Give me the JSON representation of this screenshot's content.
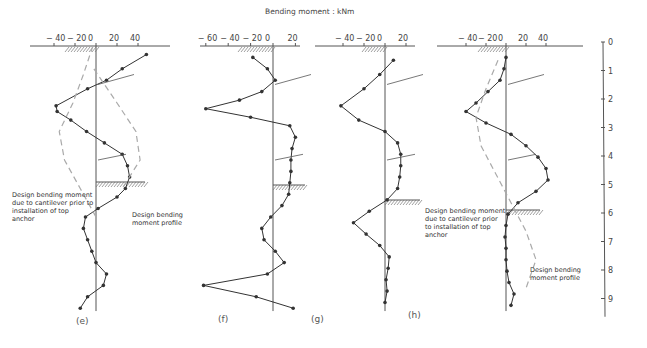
{
  "figure": {
    "title": "Bending moment : kNm",
    "depth_scale": {
      "labels": [
        "0",
        "1",
        "2",
        "3",
        "4",
        "5",
        "6",
        "7",
        "8",
        "9"
      ]
    },
    "annotations": {
      "cantilever": [
        "Design bending moment",
        "due to cantilever prior to",
        "installation of top",
        "anchor"
      ],
      "profile": [
        "Design bending",
        "moment profile"
      ],
      "cantilever_h": [
        "Design bending moment",
        "due to cantilever prior",
        "to installation of top",
        "anchor"
      ],
      "profile_h": [
        "Design bending",
        "moment profile"
      ]
    },
    "panels": [
      {
        "id": "e",
        "caption": "(e)",
        "ticks": [
          "− 40",
          "− 20",
          "0",
          "20",
          "40"
        ]
      },
      {
        "id": "f",
        "caption": "(f)",
        "ticks": [
          "− 60",
          "− 40",
          "− 20",
          "0",
          "20"
        ]
      },
      {
        "id": "g",
        "caption": "(g)",
        "ticks": [
          "− 40",
          "− 20",
          "0",
          "20"
        ]
      },
      {
        "id": "h",
        "caption": "(h)",
        "ticks": [
          "− 40",
          "− 20",
          "0",
          "20",
          "40"
        ]
      }
    ]
  },
  "chart_data": [
    {
      "type": "line",
      "title": "Bending moment : kNm",
      "panel": "(e)",
      "xlabel": "Bending moment (kNm)",
      "ylabel": "Depth (m)",
      "xlim": [
        -45,
        50
      ],
      "ylim": [
        9.5,
        0
      ],
      "series": [
        {
          "name": "Design bending moment profile",
          "depth": [
            0.3,
            0.8,
            1.2,
            1.5,
            2.1,
            2.3,
            2.6,
            3.0,
            3.4,
            3.8,
            4.2,
            4.6,
            5.0,
            5.3,
            5.7,
            6.0,
            6.4,
            6.8,
            7.2,
            7.6,
            8.0,
            8.4,
            8.8,
            9.2
          ],
          "moment": [
            48,
            25,
            10,
            -8,
            -38,
            -37,
            -24,
            -9,
            8,
            25,
            30,
            32,
            28,
            20,
            2,
            -10,
            -12,
            -8,
            -4,
            0,
            10,
            7,
            -8,
            -15
          ]
        },
        {
          "name": "Design bending moment due to cantilever prior to installation of top anchor",
          "depth": [
            0,
            1,
            2,
            3,
            4,
            5,
            6
          ],
          "moment": [
            -3,
            -12,
            -22,
            -35,
            -30,
            -15,
            0
          ]
        },
        {
          "name": "Cantilever (positive branch)",
          "depth": [
            0.8,
            2,
            3,
            4,
            5
          ],
          "moment": [
            -2,
            20,
            38,
            42,
            25
          ]
        }
      ]
    },
    {
      "type": "line",
      "panel": "(f)",
      "xlabel": "Bending moment (kNm)",
      "ylabel": "Depth (m)",
      "xlim": [
        -65,
        25
      ],
      "ylim": [
        9.5,
        0
      ],
      "series": [
        {
          "name": "Design bending moment profile",
          "depth": [
            0.4,
            0.8,
            1.2,
            1.6,
            1.9,
            2.2,
            2.5,
            2.8,
            3.2,
            3.6,
            4.0,
            4.4,
            4.8,
            5.2,
            5.6,
            6.0,
            6.4,
            6.8,
            7.2,
            7.6,
            8.0,
            8.4,
            8.8,
            9.2
          ],
          "moment": [
            -18,
            -5,
            2,
            -10,
            -30,
            -60,
            -20,
            15,
            20,
            17,
            16,
            16,
            15,
            14,
            8,
            -2,
            -10,
            -8,
            2,
            10,
            -5,
            -62,
            -15,
            18
          ]
        }
      ]
    },
    {
      "type": "line",
      "panel": "(g)",
      "xlabel": "Bending moment (kNm)",
      "ylabel": "Depth (m)",
      "xlim": [
        -45,
        25
      ],
      "ylim": [
        9.5,
        0
      ],
      "series": [
        {
          "name": "Design bending moment profile",
          "depth": [
            0.5,
            1.0,
            1.5,
            2.1,
            2.6,
            3.0,
            3.4,
            3.8,
            4.2,
            4.6,
            5.0,
            5.4,
            5.8,
            6.2,
            6.6,
            7.0,
            7.4,
            7.8,
            8.2,
            8.6,
            9.0
          ],
          "moment": [
            8,
            -5,
            -20,
            -42,
            -25,
            0,
            12,
            15,
            15,
            14,
            12,
            2,
            -15,
            -30,
            -18,
            -5,
            4,
            3,
            1,
            2,
            0
          ]
        }
      ]
    },
    {
      "type": "line",
      "panel": "(h)",
      "xlabel": "Bending moment (kNm)",
      "ylabel": "Depth (m)",
      "xlim": [
        -45,
        50
      ],
      "ylim": [
        9.5,
        0
      ],
      "series": [
        {
          "name": "Design bending moment profile",
          "depth": [
            0.4,
            0.8,
            1.2,
            1.6,
            2.0,
            2.3,
            2.7,
            3.1,
            3.5,
            3.9,
            4.3,
            4.7,
            5.1,
            5.5,
            5.9,
            6.3,
            6.7,
            7.1,
            7.5,
            7.9,
            8.3,
            8.7,
            9.1
          ],
          "moment": [
            0,
            -2,
            -6,
            -18,
            -30,
            -40,
            -20,
            5,
            20,
            32,
            40,
            42,
            30,
            12,
            2,
            0,
            -1,
            0,
            0,
            1,
            3,
            8,
            5
          ]
        },
        {
          "name": "Design bending moment due to cantilever prior to installation of top anchor",
          "depth": [
            0.5,
            1.5,
            2.5,
            3.5,
            4.5,
            5.5,
            6.5,
            7.5,
            8.5
          ],
          "moment": [
            -8,
            -20,
            -30,
            -25,
            -10,
            5,
            20,
            30,
            20
          ]
        }
      ]
    }
  ]
}
